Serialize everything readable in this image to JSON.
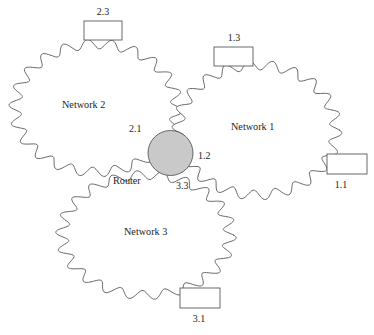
{
  "diagram": {
    "type": "network-topology",
    "background_color": "#ffffff",
    "stroke_color": "#55595e",
    "text_color": "#1d1d1d",
    "router": {
      "label": "Router",
      "shape": "circle",
      "fill_color": "#c9c9c9",
      "cx": 170.5,
      "cy": 153,
      "r": 22.5,
      "label_x": 113,
      "label_y": 182
    },
    "clouds": [
      {
        "id": "network-2",
        "label": "Network 2",
        "label_x": 62,
        "label_y": 106,
        "cx": 96,
        "cy": 108,
        "rx": 81,
        "ry": 64,
        "bumps": 22,
        "bump_depth": 0.075
      },
      {
        "id": "network-1",
        "label": "Network 1",
        "label_x": 231,
        "label_y": 128,
        "cx": 257,
        "cy": 130,
        "rx": 79,
        "ry": 65,
        "bumps": 22,
        "bump_depth": 0.075
      },
      {
        "id": "network-3",
        "label": "Network 3",
        "label_x": 124,
        "label_y": 233,
        "cx": 146,
        "cy": 235,
        "rx": 84,
        "ry": 60,
        "bumps": 22,
        "bump_depth": 0.075
      }
    ],
    "interfaces": [
      {
        "id": "iface-2-1",
        "label": "2.1",
        "x": 129,
        "y": 130,
        "network": "Network 2"
      },
      {
        "id": "iface-1-2",
        "label": "1.2",
        "x": 198,
        "y": 157,
        "network": "Network 1"
      },
      {
        "id": "iface-3-3",
        "label": "3.3",
        "x": 176,
        "y": 187,
        "network": "Network 3"
      }
    ],
    "hosts": [
      {
        "id": "host-2-3",
        "label": "2.3",
        "box": {
          "x": 84,
          "y": 21,
          "width": 38,
          "height": 19
        },
        "label_x": 103,
        "label_y": 13,
        "label_anchor": "middle",
        "network": "Network 2"
      },
      {
        "id": "host-1-3",
        "label": "1.3",
        "box": {
          "x": 214,
          "y": 47,
          "width": 39,
          "height": 19
        },
        "label_x": 234,
        "label_y": 39,
        "label_anchor": "middle",
        "network": "Network 1"
      },
      {
        "id": "host-1-1",
        "label": "1.1",
        "box": {
          "x": 327,
          "y": 154,
          "width": 40,
          "height": 20
        },
        "label_x": 341,
        "label_y": 186,
        "label_anchor": "middle",
        "network": "Network 1"
      },
      {
        "id": "host-3-1",
        "label": "3.1",
        "box": {
          "x": 180,
          "y": 288,
          "width": 40,
          "height": 20
        },
        "label_x": 199,
        "label_y": 320,
        "label_anchor": "middle",
        "network": "Network 3"
      }
    ]
  }
}
